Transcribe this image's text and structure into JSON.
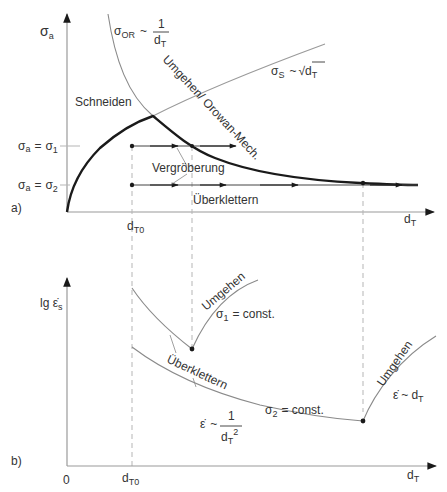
{
  "diagram": {
    "panel_a": {
      "tag": "a)",
      "y_axis_label": {
        "main": "σ",
        "sub": "a"
      },
      "x_axis_label": {
        "main": "d",
        "sub": "T"
      },
      "x_tick_dT0": {
        "main": "d",
        "sub": "T0"
      },
      "level_sigma1": {
        "lhs": "σ",
        "lhs_sub": "a",
        "eq": "=",
        "rhs": "σ",
        "rhs_sub": "1"
      },
      "level_sigma2": {
        "lhs": "σ",
        "lhs_sub": "a",
        "eq": "=",
        "rhs": "σ",
        "rhs_sub": "2"
      },
      "sigma_or_formula": {
        "sym": "σ",
        "sub": "OR",
        "tilde": "~",
        "num": "1",
        "den": "d",
        "den_sub": "T"
      },
      "sigma_s_formula": {
        "sym": "σ",
        "sub": "S",
        "tilde": "~",
        "root": "√",
        "arg": "d",
        "arg_sub": "T"
      },
      "region_schneiden": "Schneiden",
      "region_umgehen": "Umgehen/ Orowan-Mech.",
      "label_vergroeberung": "Vergröberung",
      "label_ueberklettern": "Überklettern"
    },
    "panel_b": {
      "tag": "b)",
      "y_axis_label": {
        "main": "lg ε̇",
        "sub": "s"
      },
      "x_axis_label": {
        "main": "d",
        "sub": "T"
      },
      "origin": "0",
      "x_tick_dT0": {
        "main": "d",
        "sub": "T0"
      },
      "label_umgehen_1": "Umgehen",
      "label_sigma1_const": {
        "sym": "σ",
        "sub": "1",
        "rest": "= const."
      },
      "label_ueberklettern": "Überklettern",
      "label_sigma2_const": {
        "sym": "σ",
        "sub": "2",
        "rest": "= const."
      },
      "label_rate_inv_sq": {
        "sym": "ε̇",
        "tilde": "~",
        "num": "1",
        "den": "d",
        "den_sub": "T",
        "den_sup": "2"
      },
      "label_umgehen_2": "Umgehen",
      "label_rate_linear": {
        "sym": "ε̇",
        "tilde": "~",
        "arg": "d",
        "arg_sub": "T"
      }
    },
    "colors": {
      "thick_curve": "#1a1a1a",
      "thin_curve": "#8a8a8a",
      "axis": "#9a9a9a",
      "dash": "#b0b0b0",
      "text": "#333333"
    }
  }
}
